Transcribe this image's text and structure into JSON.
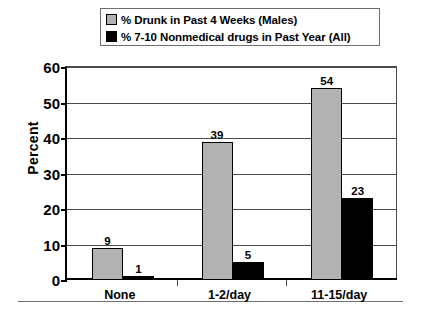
{
  "chart_data": {
    "type": "bar",
    "title": "",
    "xlabel": "",
    "ylabel": "Percent",
    "categories": [
      "None",
      "1-2/day",
      "11-15/day"
    ],
    "series": [
      {
        "name": "% Drunk in Past 4 Weeks (Males)",
        "color": "#b2b2b2",
        "values": [
          9,
          39,
          54
        ]
      },
      {
        "name": "% 7-10 Nonmedical drugs in Past Year (All)",
        "color": "#000000",
        "values": [
          1,
          5,
          23
        ]
      }
    ],
    "ylim": [
      0,
      60
    ],
    "ytick_step": 10,
    "yticks": [
      0,
      10,
      20,
      30,
      40,
      50,
      60
    ],
    "ytick_labels": [
      "0",
      "10",
      "20",
      "30",
      "40",
      "50",
      "60"
    ],
    "grid": true,
    "legend_position": "top"
  },
  "legend": {
    "entries": [
      {
        "label": "% Drunk in Past 4 Weeks (Males)",
        "swatch": "#b2b2b2"
      },
      {
        "label": "% 7-10 Nonmedical drugs in Past Year (All)",
        "swatch": "#000000"
      }
    ]
  },
  "axis": {
    "y_title": "Percent"
  }
}
